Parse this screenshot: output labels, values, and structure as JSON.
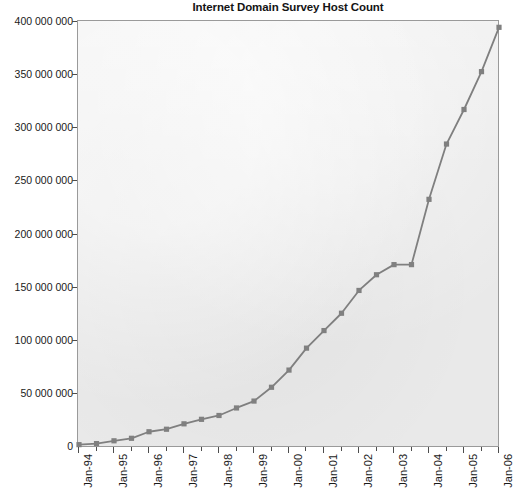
{
  "chart": {
    "title": "Internet Domain Survey Host Count"
  },
  "axes": {
    "y_tick_labels": [
      "400 000 000",
      "350 000 000",
      "300 000 000",
      "250 000 000",
      "200 000 000",
      "150 000 000",
      "100 000 000",
      "50 000 000",
      "0"
    ],
    "x_tick_labels": [
      "Jan-94",
      "Jan-95",
      "Jan-96",
      "Jan-97",
      "Jan-98",
      "Jan-99",
      "Jan-00",
      "Jan-01",
      "Jan-02",
      "Jan-03",
      "Jan-04",
      "Jan-05",
      "Jan-06"
    ]
  },
  "colors": {
    "line": "#7f7f7f",
    "marker": "#808080",
    "plot_background": "#e9e9e9",
    "axis": "#9a9a9a",
    "text": "#1a1a1a"
  },
  "chart_data": {
    "type": "line",
    "title": "Internet Domain Survey Host Count",
    "xlabel": "",
    "ylabel": "",
    "grid": false,
    "legend": "none",
    "marker": "square",
    "xlim": [
      "Jan-94",
      "Jan-06"
    ],
    "ylim": [
      0,
      400000000
    ],
    "ytick_step": 50000000,
    "categories": [
      "Jan-94",
      "Jul-94",
      "Jan-95",
      "Jul-95",
      "Jan-96",
      "Jul-96",
      "Jan-97",
      "Jul-97",
      "Jan-98",
      "Jul-98",
      "Jan-99",
      "Jul-99",
      "Jan-00",
      "Jul-00",
      "Jan-01",
      "Jul-01",
      "Jan-02",
      "Jul-02",
      "Jan-03",
      "Jul-03",
      "Jan-04",
      "Jul-04",
      "Jan-05",
      "Jul-05",
      "Jan-06"
    ],
    "values": [
      2217000,
      3212000,
      5846000,
      8200000,
      14352000,
      16729000,
      21819000,
      26053000,
      29670000,
      36739000,
      43230000,
      56218000,
      72398000,
      93047000,
      109574000,
      125888000,
      147344000,
      162128000,
      171638000,
      171638000,
      233101000,
      285139000,
      317646000,
      353284000,
      394992000
    ],
    "series": [
      {
        "name": "Host Count",
        "values": [
          2217000,
          3212000,
          5846000,
          8200000,
          14352000,
          16729000,
          21819000,
          26053000,
          29670000,
          36739000,
          43230000,
          56218000,
          72398000,
          93047000,
          109574000,
          125888000,
          147344000,
          162128000,
          171638000,
          171638000,
          233101000,
          285139000,
          317646000,
          353284000,
          394992000
        ]
      }
    ]
  }
}
